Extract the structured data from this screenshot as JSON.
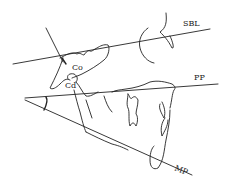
{
  "diagram": {
    "type": "cephalometric tracing",
    "line_color": "#222222",
    "background": "#ffffff",
    "labels": {
      "sbl": "SBL",
      "pp": "PP",
      "mp": "MP",
      "co": "Co",
      "cd": "Cd"
    },
    "lines": [
      "SBL (sella-basion line)",
      "PP (palatal plane)",
      "MP (mandibular plane)",
      "Ramus tangent"
    ]
  }
}
